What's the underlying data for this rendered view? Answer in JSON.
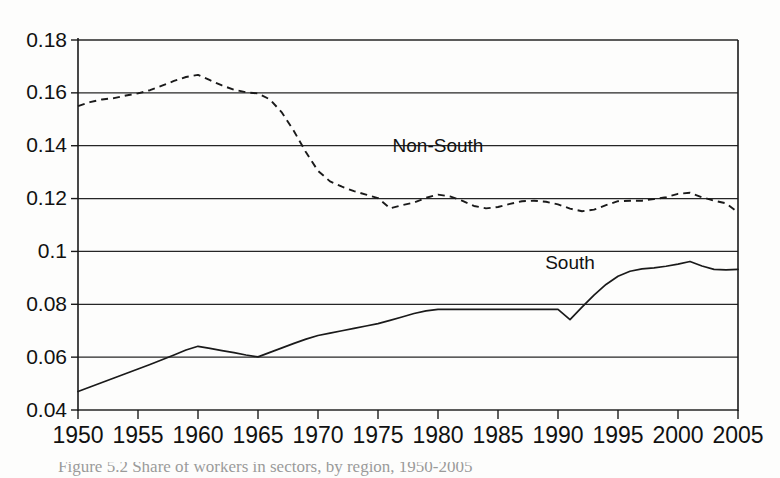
{
  "figure": {
    "background_color": "#fdfdfc",
    "ink_color": "#1a1a1a",
    "caption": "Figure 5.2  Share of workers in sectors, by region, 1950-2005"
  },
  "chart_data": {
    "type": "line",
    "title": "",
    "subtitle": "",
    "xlabel": "",
    "ylabel": "",
    "xlim": [
      1950,
      2005
    ],
    "ylim": [
      0.04,
      0.18
    ],
    "grid": "horizontal",
    "legend_position": "inline-annotations",
    "x_tick_labels": [
      "1950",
      "1955",
      "1960",
      "1965",
      "1970",
      "1975",
      "1980",
      "1985",
      "1990",
      "1995",
      "2000",
      "2005"
    ],
    "x_ticks": [
      1950,
      1955,
      1960,
      1965,
      1970,
      1975,
      1980,
      1985,
      1990,
      1995,
      2000,
      2005
    ],
    "y_tick_labels": [
      "0.04",
      "0.06",
      "0.08",
      "0.1",
      "0.12",
      "0.14",
      "0.16",
      "0.18"
    ],
    "y_ticks": [
      0.04,
      0.06,
      0.08,
      0.1,
      0.12,
      0.14,
      0.16,
      0.18
    ],
    "series": [
      {
        "name": "Non-South",
        "style": "dashed",
        "label_x": 1980,
        "label_y": 0.1375,
        "x": [
          1950,
          1951,
          1952,
          1953,
          1954,
          1955,
          1956,
          1957,
          1958,
          1959,
          1960,
          1961,
          1962,
          1963,
          1964,
          1965,
          1966,
          1967,
          1968,
          1969,
          1970,
          1971,
          1972,
          1973,
          1974,
          1975,
          1976,
          1977,
          1978,
          1979,
          1980,
          1981,
          1982,
          1983,
          1984,
          1985,
          1986,
          1987,
          1988,
          1989,
          1990,
          1991,
          1992,
          1993,
          1994,
          1995,
          1996,
          1997,
          1998,
          1999,
          2000,
          2001,
          2002,
          2003,
          2004,
          2005
        ],
        "y": [
          0.155,
          0.1565,
          0.1575,
          0.158,
          0.159,
          0.1598,
          0.161,
          0.1627,
          0.1645,
          0.166,
          0.1668,
          0.1648,
          0.1628,
          0.1612,
          0.1602,
          0.1598,
          0.1575,
          0.1525,
          0.1455,
          0.1375,
          0.1305,
          0.1265,
          0.1245,
          0.1228,
          0.1215,
          0.1202,
          0.1163,
          0.1175,
          0.1185,
          0.1203,
          0.1215,
          0.1208,
          0.1192,
          0.1172,
          0.1163,
          0.1168,
          0.118,
          0.119,
          0.1192,
          0.1188,
          0.1178,
          0.1162,
          0.1152,
          0.1158,
          0.1175,
          0.119,
          0.1192,
          0.1192,
          0.1198,
          0.1205,
          0.1218,
          0.1222,
          0.1205,
          0.1192,
          0.1182,
          0.1148
        ]
      },
      {
        "name": "South",
        "style": "solid",
        "label_x": 1991,
        "label_y": 0.0935,
        "x": [
          1950,
          1951,
          1952,
          1953,
          1954,
          1955,
          1956,
          1957,
          1958,
          1959,
          1960,
          1961,
          1962,
          1963,
          1964,
          1965,
          1966,
          1967,
          1968,
          1969,
          1970,
          1971,
          1972,
          1973,
          1974,
          1975,
          1976,
          1977,
          1978,
          1979,
          1980,
          1981,
          1982,
          1983,
          1984,
          1985,
          1986,
          1987,
          1988,
          1989,
          1990,
          1991,
          1992,
          1993,
          1994,
          1995,
          1996,
          1997,
          1998,
          1999,
          2000,
          2001,
          2002,
          2003,
          2004,
          2005
        ],
        "y": [
          0.047,
          0.0487,
          0.0504,
          0.0521,
          0.0538,
          0.0555,
          0.0572,
          0.059,
          0.0608,
          0.0627,
          0.0641,
          0.0633,
          0.0625,
          0.0617,
          0.0608,
          0.0601,
          0.0618,
          0.0635,
          0.0652,
          0.0668,
          0.0682,
          0.0691,
          0.07,
          0.0709,
          0.0718,
          0.0727,
          0.0739,
          0.0752,
          0.0765,
          0.0775,
          0.0781,
          0.0781,
          0.0781,
          0.0781,
          0.0781,
          0.0781,
          0.0781,
          0.0781,
          0.0781,
          0.0781,
          0.0781,
          0.0742,
          0.0789,
          0.0835,
          0.0875,
          0.0906,
          0.0925,
          0.0934,
          0.0938,
          0.0944,
          0.0952,
          0.0962,
          0.0945,
          0.0932,
          0.093,
          0.0932
        ]
      }
    ]
  }
}
